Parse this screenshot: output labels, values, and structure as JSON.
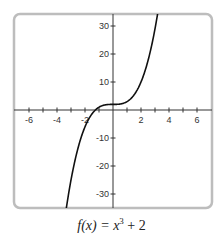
{
  "chart_data": {
    "type": "line",
    "title": "",
    "function": "x^3 + 2",
    "caption": {
      "prefix": "f(x) = x",
      "exponent": "3",
      "suffix": " + 2"
    },
    "xlabel": "",
    "ylabel": "",
    "xlim": [
      -7,
      7
    ],
    "ylim": [
      -35,
      35
    ],
    "x_ticks": [
      -6,
      -5,
      -4,
      -3,
      -2,
      -1,
      1,
      2,
      3,
      4,
      5,
      6
    ],
    "x_tick_labels": [
      "-6",
      "-4",
      "-2",
      "2",
      "4",
      "6"
    ],
    "x_tick_label_values": [
      -6,
      -4,
      -2,
      2,
      4,
      6
    ],
    "y_ticks": [
      30,
      20,
      10,
      -10,
      -20,
      -30
    ],
    "y_tick_labels": [
      "30",
      "20",
      "10",
      "-10",
      "-20",
      "-30"
    ],
    "grid": false,
    "legend": null,
    "series": [
      {
        "name": "f(x) = x^3 + 2",
        "x": [
          -3.2,
          -3,
          -2.5,
          -2,
          -1.5,
          -1,
          -0.5,
          0,
          0.5,
          1,
          1.5,
          2,
          2.5,
          3,
          3.2
        ],
        "y": [
          -30.77,
          -25,
          -13.63,
          -6,
          -1.38,
          1,
          1.88,
          2,
          2.13,
          3,
          5.38,
          10,
          17.63,
          29,
          34.77
        ]
      }
    ],
    "colors": {
      "curve": "#111111",
      "axes": "#333333",
      "frame": "#bbbbbb"
    }
  }
}
